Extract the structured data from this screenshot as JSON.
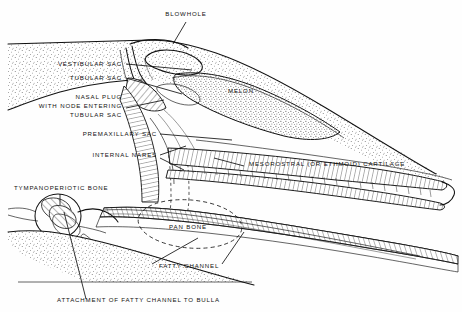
{
  "figure": {
    "type": "anatomical-cross-section",
    "background_color": "#fefefe",
    "ink_color": "#111111"
  },
  "labels": [
    {
      "id": "blowhole",
      "text": "BLOWHOLE",
      "x": 186,
      "y": 16,
      "anchor": "middle"
    },
    {
      "id": "vestibular-sac",
      "text": "VESTIBULAR SAC",
      "x": 122,
      "y": 66,
      "anchor": "end"
    },
    {
      "id": "tubular-sac",
      "text": "TUBULAR SAC",
      "x": 122,
      "y": 80,
      "anchor": "end"
    },
    {
      "id": "nasal-plug-1",
      "text": "NASAL PLUG",
      "x": 122,
      "y": 99,
      "anchor": "end"
    },
    {
      "id": "nasal-plug-2",
      "text": "WITH NODE ENTERING",
      "x": 122,
      "y": 108,
      "anchor": "end"
    },
    {
      "id": "nasal-plug-3",
      "text": "TUBULAR SAC",
      "x": 122,
      "y": 117,
      "anchor": "end"
    },
    {
      "id": "premaxillary-sac",
      "text": "PREMAXILLARY SAC",
      "x": 157,
      "y": 136,
      "anchor": "end"
    },
    {
      "id": "internal-nares",
      "text": "INTERNAL NARES",
      "x": 157,
      "y": 157,
      "anchor": "end"
    },
    {
      "id": "tympanoperiotic",
      "text": "TYMPANOPERIOTIC BONE",
      "x": 14,
      "y": 190,
      "anchor": "start"
    },
    {
      "id": "melon",
      "text": "MELON",
      "x": 241,
      "y": 93,
      "anchor": "middle"
    },
    {
      "id": "mesorostral",
      "text": "MESOROSTRAL (OR ETHMOID) CARTILAGE",
      "x": 249,
      "y": 166,
      "anchor": "start"
    },
    {
      "id": "pan-bone",
      "text": "PAN BONE",
      "x": 188,
      "y": 229,
      "anchor": "middle"
    },
    {
      "id": "fatty-channel",
      "text": "FATTY CHANNEL",
      "x": 159,
      "y": 268,
      "anchor": "start"
    },
    {
      "id": "attachment",
      "text": "ATTACHMENT OF FATTY CHANNEL TO BULLA",
      "x": 57,
      "y": 302,
      "anchor": "start"
    }
  ]
}
